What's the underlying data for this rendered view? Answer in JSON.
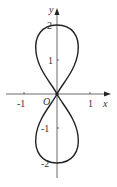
{
  "figure": {
    "axes": {
      "x_label": "x",
      "y_label": "y",
      "origin_label": "O",
      "x_ticks": [
        "-1",
        "1"
      ],
      "y_ticks": [
        "2",
        "1",
        "-1",
        "-2"
      ]
    },
    "curve": {
      "type": "figure-eight",
      "y_range": [
        -2,
        2
      ],
      "x_range": [
        -0.66,
        0.66
      ],
      "color": "#222222"
    }
  }
}
